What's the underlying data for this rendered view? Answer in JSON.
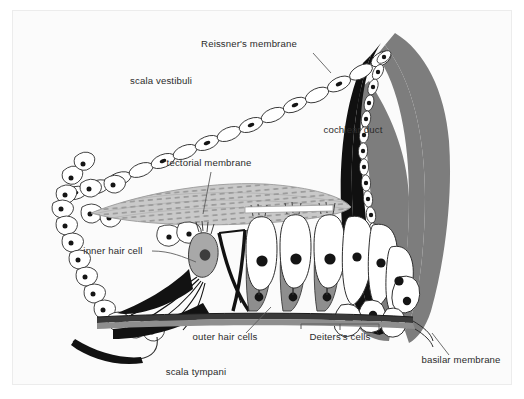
{
  "figure": {
    "background_color": "#ffffff",
    "frame_color": "#ececec",
    "interior_color": "#fbfbfb"
  },
  "palette": {
    "ink": "#2e2e2e",
    "label_text": "#2b2b2b",
    "leader_line": "#5d5d5d",
    "spiral_ligament_gray": "#7d7d7d",
    "stria_black": "#101010",
    "tectorial_gray": "#c9c9c9",
    "tectorial_striation": "#8d8d8d",
    "supporting_cell_gray": "#9b9b9b",
    "hair_cell_white": "#ffffff",
    "nucleus_black": "#151515",
    "basilar_membrane": "#3a3a3a"
  },
  "labels": [
    {
      "id": "reissners-membrane",
      "text": "Reissner's membrane",
      "x": 236,
      "y": 36,
      "anchor": "middle",
      "leader": [
        [
          300,
          42
        ],
        [
          318,
          62
        ]
      ]
    },
    {
      "id": "scala-vestibuli",
      "text": "scala vestibuli",
      "x": 148,
      "y": 73,
      "anchor": "middle",
      "leader": null
    },
    {
      "id": "cochlear-duct",
      "text": "cochlear duct",
      "x": 340,
      "y": 122,
      "anchor": "middle",
      "leader": null
    },
    {
      "id": "tectorial-membrane",
      "text": "tectorial membrane",
      "x": 196,
      "y": 155,
      "anchor": "middle",
      "leader": [
        [
          198,
          161
        ],
        [
          190,
          203
        ]
      ]
    },
    {
      "id": "inner-hair-cell",
      "text": "inner hair cell",
      "x": 100,
      "y": 243,
      "anchor": "middle",
      "leader": [
        [
          139,
          240
        ],
        [
          183,
          251
        ]
      ]
    },
    {
      "id": "outer-hair-cells",
      "text": "outer hair cells",
      "x": 212,
      "y": 329,
      "anchor": "middle",
      "leader": [
        [
          233,
          322
        ],
        [
          258,
          296
        ]
      ]
    },
    {
      "id": "deiterss-cells",
      "text": "Deiters's cells",
      "x": 327,
      "y": 329,
      "anchor": "middle",
      "brace": {
        "x1": 288,
        "x2": 366,
        "y": 318,
        "tip_y": 313
      }
    },
    {
      "id": "scala-tympani",
      "text": "scala tympani",
      "x": 183,
      "y": 364,
      "anchor": "middle",
      "leader": null
    },
    {
      "id": "basilar-membrane",
      "text": "basilar membrane",
      "x": 448,
      "y": 352,
      "anchor": "middle",
      "leader": [
        [
          436,
          344
        ],
        [
          419,
          322
        ]
      ]
    }
  ],
  "structures": [
    {
      "id": "spiral-ligament",
      "name": "spiral ligament",
      "fill": "#7d7d7d",
      "description": "large gray crescent along the right margin"
    },
    {
      "id": "stria-vascularis",
      "name": "stria vascularis",
      "fill": "#101010",
      "description": "black band lining the inner edge of the spiral ligament"
    },
    {
      "id": "reissners-membrane-cells",
      "name": "Reissner's membrane cell chain",
      "count": 14,
      "description": "thin chain of flattened cells with dark nuclei from spiral limbus to stria"
    },
    {
      "id": "spiral-limbus-epithelium",
      "name": "spiral limbus epithelium",
      "count": 28,
      "description": "chain of outlined cells with black dot nuclei on the left"
    },
    {
      "id": "tectorial-membrane",
      "name": "tectorial membrane",
      "fill": "#c9c9c9",
      "description": "striated gray wedge overhanging the organ of Corti"
    },
    {
      "id": "inner-hair-cell",
      "name": "inner hair cell",
      "count": 1,
      "description": "gray flask-shaped cell with dark nucleus medial to the pillar cells"
    },
    {
      "id": "outer-hair-cells",
      "name": "outer hair cells",
      "count": 3,
      "description": "elongated white cells with black nuclei and apical stereocilia"
    },
    {
      "id": "deiterss-cells",
      "name": "Deiters's cells",
      "count": 3,
      "description": "dark gray supporting cells cradling the outer hair cells"
    },
    {
      "id": "pillar-cells",
      "name": "pillar cells / tunnel of Corti",
      "description": "paired black struts forming the triangular tunnel"
    },
    {
      "id": "basilar-membrane",
      "name": "basilar membrane",
      "fill": "#3a3a3a",
      "description": "thin horizontal band beneath the organ of Corti"
    },
    {
      "id": "claudius-cells",
      "name": "Claudius cells",
      "count": 9,
      "description": "white rounded cells along the outer sulcus near the spiral ligament"
    }
  ]
}
